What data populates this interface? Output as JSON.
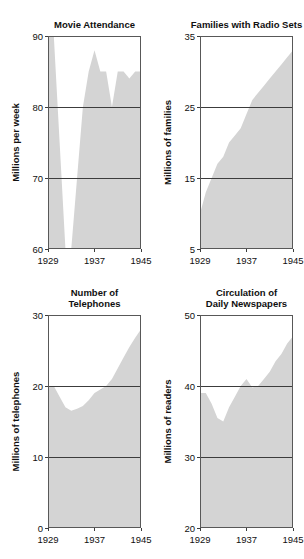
{
  "figure": {
    "background_color": "#ffffff",
    "fill_color": "#d4d4d4",
    "frame_color": "#585858",
    "text_color": "#101010"
  },
  "chart_data": [
    {
      "type": "area",
      "panel": "top-left",
      "title": "Movie Attendance",
      "title_lines": [
        "Movie Attendance"
      ],
      "xlabel": "",
      "ylabel": "Millions per week",
      "xlim": [
        1929,
        1945
      ],
      "ylim": [
        60,
        90
      ],
      "xticks": [
        1929,
        1937,
        1945
      ],
      "xtick_labels": [
        "1929",
        "1937",
        "1945"
      ],
      "yticks": [
        60,
        70,
        80,
        90
      ],
      "ytick_labels": [
        "60",
        "70",
        "80",
        "90"
      ],
      "gridlines_y": [
        70,
        80
      ],
      "grid": true,
      "legend": "none",
      "x": [
        1929,
        1930,
        1931,
        1932,
        1933,
        1934,
        1935,
        1936,
        1937,
        1938,
        1939,
        1940,
        1941,
        1942,
        1943,
        1944,
        1945
      ],
      "values": [
        90,
        90,
        75,
        60,
        60,
        70,
        80,
        85,
        88,
        85,
        85,
        80,
        85,
        85,
        84,
        85,
        85
      ]
    },
    {
      "type": "area",
      "panel": "top-right",
      "title": "Families with Radio Sets",
      "title_lines": [
        "Families with Radio Sets"
      ],
      "xlabel": "",
      "ylabel": "Millions of families",
      "xlim": [
        1929,
        1945
      ],
      "ylim": [
        5,
        35
      ],
      "xticks": [
        1929,
        1937,
        1945
      ],
      "xtick_labels": [
        "1929",
        "1937",
        "1945"
      ],
      "yticks": [
        5,
        15,
        25,
        35
      ],
      "ytick_labels": [
        "5",
        "15",
        "25",
        "35"
      ],
      "gridlines_y": [
        15,
        25
      ],
      "grid": true,
      "legend": "none",
      "x": [
        1929,
        1930,
        1931,
        1932,
        1933,
        1934,
        1935,
        1936,
        1937,
        1938,
        1939,
        1940,
        1941,
        1942,
        1943,
        1944,
        1945
      ],
      "values": [
        10,
        13,
        15,
        17,
        18,
        20,
        21,
        22,
        24,
        26,
        27,
        28,
        29,
        30,
        31,
        32,
        33
      ]
    },
    {
      "type": "area",
      "panel": "bottom-left",
      "title": "Number of Telephones",
      "title_lines": [
        "Number of",
        "Telephones"
      ],
      "xlabel": "",
      "ylabel": "Millions of telephones",
      "xlim": [
        1929,
        1945
      ],
      "ylim": [
        0,
        30
      ],
      "xticks": [
        1929,
        1937,
        1945
      ],
      "xtick_labels": [
        "1929",
        "1937",
        "1945"
      ],
      "yticks": [
        0,
        10,
        20,
        30
      ],
      "ytick_labels": [
        "0",
        "10",
        "20",
        "30"
      ],
      "gridlines_y": [
        10,
        20
      ],
      "grid": true,
      "legend": "none",
      "x": [
        1929,
        1930,
        1931,
        1932,
        1933,
        1934,
        1935,
        1936,
        1937,
        1938,
        1939,
        1940,
        1941,
        1942,
        1943,
        1944,
        1945
      ],
      "values": [
        20,
        20,
        18.5,
        17,
        16.5,
        16.8,
        17.2,
        18,
        19,
        19.5,
        20,
        21,
        22.5,
        24,
        25.5,
        26.8,
        28
      ]
    },
    {
      "type": "area",
      "panel": "bottom-right",
      "title": "Circulation of Daily Newspapers",
      "title_lines": [
        "Circulation of",
        "Daily Newspapers"
      ],
      "xlabel": "",
      "ylabel": "Millions of readers",
      "xlim": [
        1929,
        1945
      ],
      "ylim": [
        20,
        50
      ],
      "xticks": [
        1929,
        1937,
        1945
      ],
      "xtick_labels": [
        "1929",
        "1937",
        "1945"
      ],
      "yticks": [
        20,
        30,
        40,
        50
      ],
      "ytick_labels": [
        "20",
        "30",
        "40",
        "50"
      ],
      "gridlines_y": [
        30,
        40
      ],
      "grid": true,
      "legend": "none",
      "x": [
        1929,
        1930,
        1931,
        1932,
        1933,
        1934,
        1935,
        1936,
        1937,
        1938,
        1939,
        1940,
        1941,
        1942,
        1943,
        1944,
        1945
      ],
      "values": [
        39,
        39,
        37.5,
        35.5,
        35,
        37,
        38.5,
        40,
        41,
        39.8,
        40,
        41,
        42,
        43.5,
        44.5,
        46,
        47
      ]
    }
  ]
}
